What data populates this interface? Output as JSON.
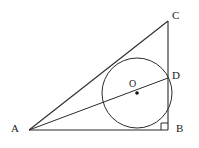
{
  "figure": {
    "background_color": "#ffffff",
    "stroke_color": "#2b2b2b",
    "label_color": "#1a1a1a",
    "width": 199,
    "height": 148
  },
  "labels": {
    "a": "A",
    "b": "B",
    "c": "C",
    "d": "D",
    "o": "O"
  },
  "points": {
    "A": {
      "x": 29,
      "y": 130,
      "name": "A"
    },
    "B": {
      "x": 168,
      "y": 130,
      "name": "B"
    },
    "C": {
      "x": 168,
      "y": 21,
      "name": "C"
    },
    "D": {
      "x": 168,
      "y": 78,
      "name": "D"
    },
    "O": {
      "x": 137,
      "y": 93,
      "name": "O"
    }
  },
  "circle": {
    "center_x": 137,
    "center_y": 93,
    "radius": 35
  },
  "segments": [
    {
      "name": "side-AB",
      "x1": 29,
      "y1": 130,
      "x2": 168,
      "y2": 130
    },
    {
      "name": "side-BC",
      "x1": 168,
      "y1": 130,
      "x2": 168,
      "y2": 21
    },
    {
      "name": "side-AC",
      "x1": 29,
      "y1": 130,
      "x2": 168,
      "y2": 21
    },
    {
      "name": "segment-AD",
      "x1": 29,
      "y1": 130,
      "x2": 168,
      "y2": 78
    }
  ],
  "right_angle": {
    "at": "B",
    "size": 7,
    "marker": "square"
  }
}
